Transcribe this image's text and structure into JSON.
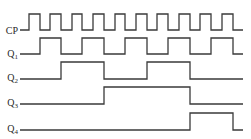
{
  "title": "",
  "diagram": {
    "type": "timing-diagram",
    "x_start": 20,
    "x_end": 243,
    "stroke_color": "#3a3a3a",
    "background": "#ffffff",
    "signals": [
      {
        "name": "CP",
        "label_main": "CP",
        "label_sub": "",
        "label_y": 34,
        "high_y": 14,
        "low_y": 30,
        "initial": 0,
        "transitions": [
          29,
          40,
          50,
          61,
          72,
          82,
          93,
          104,
          115,
          125,
          136,
          147,
          157,
          168,
          179,
          190,
          200,
          211,
          222,
          233
        ]
      },
      {
        "name": "Q1",
        "label_main": "Q",
        "label_sub": "1",
        "label_y": 57,
        "high_y": 38,
        "low_y": 54,
        "initial": 0,
        "transitions": [
          40,
          61,
          82,
          104,
          125,
          147,
          168,
          190,
          211,
          233
        ]
      },
      {
        "name": "Q2",
        "label_main": "Q",
        "label_sub": "2",
        "label_y": 81,
        "high_y": 62,
        "low_y": 79,
        "initial": 0,
        "transitions": [
          61,
          104,
          147,
          190
        ]
      },
      {
        "name": "Q3",
        "label_main": "Q",
        "label_sub": "3",
        "label_y": 106,
        "high_y": 87,
        "low_y": 104,
        "initial": 0,
        "transitions": [
          104,
          190
        ]
      },
      {
        "name": "Q4",
        "label_main": "Q",
        "label_sub": "4",
        "label_y": 132,
        "high_y": 113,
        "low_y": 130,
        "initial": 0,
        "transitions": [
          190,
          233
        ]
      }
    ]
  }
}
